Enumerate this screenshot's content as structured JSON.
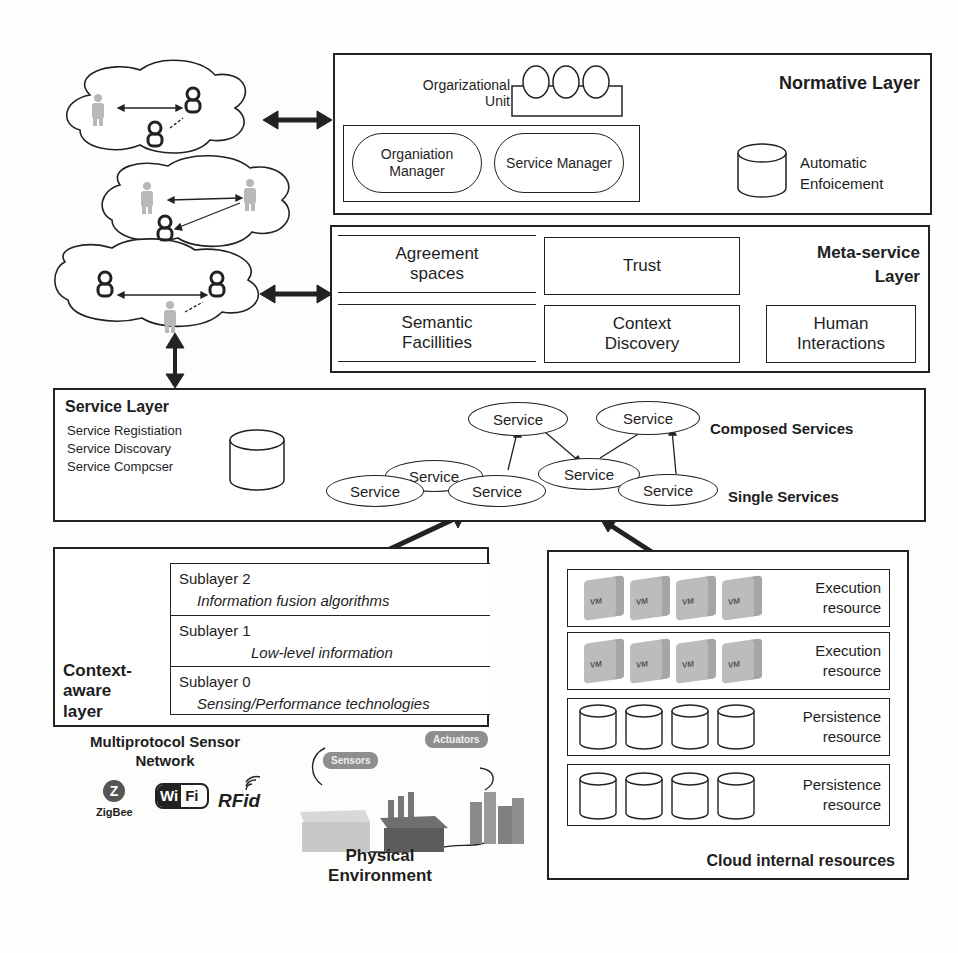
{
  "normative_layer": {
    "title": "Normative Layer",
    "org_unit_label_line1": "Orgarizational",
    "org_unit_label_line2": "Unit",
    "organization_manager": "Organiation Manager",
    "service_manager": "Service Manager",
    "automatic_enforcement_line1": "Automatic",
    "automatic_enforcement_line2": "Enfoicement"
  },
  "meta_service_layer": {
    "title_line1": "Meta-service",
    "title_line2": "Layer",
    "cells": {
      "agreement_spaces": "Agreement spaces",
      "trust": "Trust",
      "semantic_facilities": "Semantic Facillities",
      "context_discovery": "Context Discovery",
      "human_interactions": "Human Interactions"
    }
  },
  "service_layer": {
    "title": "Service Layer",
    "functions": [
      "Service Registiation",
      "Service Discovary",
      "Service Compcser"
    ],
    "composed_label": "Composed Services",
    "single_label": "Single Services",
    "service_node_label": "Service"
  },
  "context_aware_layer": {
    "title_line1": "Context-",
    "title_line2": "aware",
    "title_line3": "layer",
    "sublayers": [
      {
        "name": "Sublayer 2",
        "desc": "Information fusion algorithms"
      },
      {
        "name": "Sublayer 1",
        "desc": "Low-level information"
      },
      {
        "name": "Sublayer 0",
        "desc": "Sensing/Performance  technologies"
      }
    ]
  },
  "cloud_resources": {
    "title": "Cloud internal resources",
    "rows": [
      {
        "line1": "Execution",
        "line2": "resource",
        "kind": "vm"
      },
      {
        "line1": "Execution",
        "line2": "resource",
        "kind": "vm"
      },
      {
        "line1": "Persistence",
        "line2": "resource",
        "kind": "db"
      },
      {
        "line1": "Persistence",
        "line2": "resource",
        "kind": "db"
      }
    ],
    "vm_label": "VM"
  },
  "sensor_network": {
    "title_line1": "Multiprotocol Sensor",
    "title_line2": "Network",
    "zigbee": "ZigBee",
    "wifi_left": "Wi",
    "wifi_right": "Fi",
    "rfid": "RFid"
  },
  "physical_environment": {
    "title_line1": "Physical",
    "title_line2": "Environment",
    "sensors_tag": "Sensors",
    "actuators_tag": "Actuators"
  },
  "colors": {
    "line": "#222222",
    "human_icon": "#b8b8b8",
    "vm_cube": "#bcbcbc",
    "tag": "#8e8e8e"
  }
}
